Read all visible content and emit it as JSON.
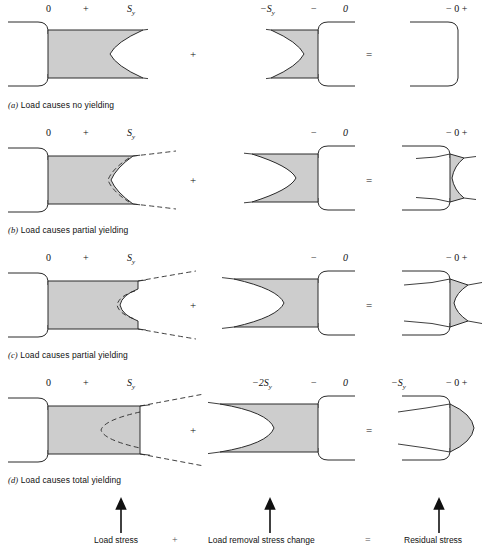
{
  "figure": {
    "shade_color": "#cdcdcd",
    "line_color": "#2a2a2a",
    "columns": [
      "Load stress",
      "Load removal stress change",
      "Residual stress"
    ]
  },
  "rows": [
    {
      "id": "a",
      "caption_prefix": "(a)",
      "caption": "Load causes no yielding",
      "col1_labels": [
        "0",
        "+",
        "S",
        "y"
      ],
      "col2_labels": [
        "−S",
        "y",
        "−",
        "0"
      ],
      "col3_labels": [
        "− 0 +"
      ]
    },
    {
      "id": "b",
      "caption_prefix": "(b)",
      "caption": "Load causes partial yielding",
      "col1_labels": [
        "0",
        "+",
        "S",
        "y"
      ],
      "col2_labels": [
        "−",
        "0"
      ],
      "col3_labels": [
        "− 0 +"
      ]
    },
    {
      "id": "c",
      "caption_prefix": "(c)",
      "caption": "Load causes partial yielding",
      "col1_labels": [
        "0",
        "+",
        "S",
        "y"
      ],
      "col2_labels": [
        "−",
        "0"
      ],
      "col3_labels": [
        "− 0 +"
      ]
    },
    {
      "id": "d",
      "caption_prefix": "(d)",
      "caption": "Load causes total yielding",
      "col1_labels": [
        "0",
        "+",
        "S",
        "y"
      ],
      "col2_labels": [
        "−2S",
        "y",
        "−",
        "0"
      ],
      "col3_labels": [
        "−S",
        "y",
        "− 0 +"
      ]
    }
  ],
  "operators": {
    "plus": "+",
    "equals": "="
  },
  "footer": {
    "load_stress": "Load stress",
    "plus": "+",
    "load_removal": "Load removal stress change",
    "equals": "=",
    "residual": "Residual stress"
  }
}
